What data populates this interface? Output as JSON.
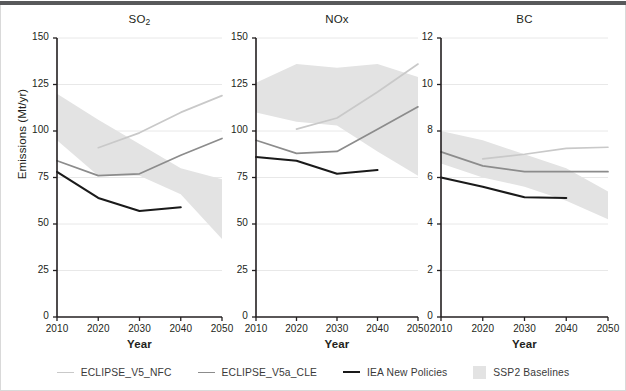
{
  "figure": {
    "ylabel": "Emissions (Mt/yr)",
    "xlabel_so2": "Year",
    "xlabel_nox": "Year",
    "xlabel_bc": "Year",
    "top_bar_color": "#58595b",
    "grid_color": "#e8e8e8",
    "axis_color": "#231f20"
  },
  "legend": {
    "position": "bottom-center",
    "items": [
      {
        "label": "ECLIPSE_V5_NFC",
        "type": "line",
        "color": "#c9c9c9"
      },
      {
        "label": "ECLIPSE_V5a_CLE",
        "type": "line",
        "color": "#8c8c8c"
      },
      {
        "label": "IEA New Policies",
        "type": "line",
        "color": "#1a1a1a"
      },
      {
        "label": "SSP2 Baselines",
        "type": "band",
        "color": "#e3e3e3"
      }
    ]
  },
  "chart_data": [
    {
      "type": "line",
      "title": "SO2",
      "title_display": "SO",
      "title_sub": "2",
      "xlabel": "Year",
      "ylabel": "Emissions (Mt/yr)",
      "xlim": [
        2010,
        2050
      ],
      "ylim": [
        0,
        150
      ],
      "yticks": [
        0,
        25,
        50,
        75,
        100,
        125,
        150
      ],
      "xticks": [
        2010,
        2020,
        2030,
        2040,
        2050
      ],
      "grid": true,
      "band": {
        "name": "SSP2 Baselines",
        "x": [
          2010,
          2020,
          2030,
          2040,
          2050
        ],
        "upper": [
          120,
          106,
          93,
          80,
          74
        ],
        "lower": [
          95,
          76,
          76,
          66,
          42
        ]
      },
      "series": [
        {
          "name": "ECLIPSE_V5_NFC",
          "color": "#c9c9c9",
          "x": [
            2020,
            2030,
            2040,
            2050
          ],
          "values": [
            91,
            99,
            110,
            119
          ]
        },
        {
          "name": "ECLIPSE_V5a_CLE",
          "color": "#8c8c8c",
          "x": [
            2010,
            2020,
            2030,
            2040,
            2050
          ],
          "values": [
            84,
            76,
            77,
            87,
            96
          ]
        },
        {
          "name": "IEA New Policies",
          "color": "#1a1a1a",
          "x": [
            2010,
            2020,
            2030,
            2040
          ],
          "values": [
            78,
            64,
            57,
            59
          ]
        }
      ]
    },
    {
      "type": "line",
      "title": "NOx",
      "title_display": "NOx",
      "title_sub": "",
      "xlabel": "Year",
      "ylabel": "Emissions (Mt/yr)",
      "xlim": [
        2010,
        2050
      ],
      "ylim": [
        0,
        150
      ],
      "yticks": [
        0,
        25,
        50,
        75,
        100,
        125,
        150
      ],
      "xticks": [
        2010,
        2020,
        2030,
        2040,
        2050
      ],
      "grid": true,
      "band": {
        "name": "SSP2 Baselines",
        "x": [
          2010,
          2020,
          2030,
          2040,
          2050
        ],
        "upper": [
          126,
          136,
          134,
          136,
          129
        ],
        "lower": [
          110,
          105,
          103,
          89,
          76
        ]
      },
      "series": [
        {
          "name": "ECLIPSE_V5_NFC",
          "color": "#c9c9c9",
          "x": [
            2020,
            2030,
            2040,
            2050
          ],
          "values": [
            101,
            107,
            121,
            136
          ]
        },
        {
          "name": "ECLIPSE_V5a_CLE",
          "color": "#8c8c8c",
          "x": [
            2010,
            2020,
            2030,
            2040,
            2050
          ],
          "values": [
            95,
            88,
            89,
            101,
            113
          ]
        },
        {
          "name": "IEA New Policies",
          "color": "#1a1a1a",
          "x": [
            2010,
            2020,
            2030,
            2040
          ],
          "values": [
            86,
            84,
            77,
            79
          ]
        }
      ]
    },
    {
      "type": "line",
      "title": "BC",
      "title_display": "BC",
      "title_sub": "",
      "xlabel": "Year",
      "ylabel": "Emissions (Mt/yr)",
      "xlim": [
        2010,
        2050
      ],
      "ylim": [
        0,
        12
      ],
      "yticks": [
        0,
        2,
        4,
        6,
        8,
        10,
        12
      ],
      "xticks": [
        2010,
        2020,
        2030,
        2040,
        2050
      ],
      "grid": true,
      "band": {
        "name": "SSP2 Baselines",
        "x": [
          2010,
          2020,
          2030,
          2040,
          2050
        ],
        "upper": [
          8.0,
          7.6,
          7.0,
          6.4,
          5.4
        ],
        "lower": [
          6.6,
          6.0,
          5.6,
          5.0,
          4.2
        ]
      },
      "series": [
        {
          "name": "ECLIPSE_V5_NFC",
          "color": "#c9c9c9",
          "x": [
            2020,
            2030,
            2040,
            2050
          ],
          "values": [
            6.8,
            7.0,
            7.25,
            7.3
          ]
        },
        {
          "name": "ECLIPSE_V5a_CLE",
          "color": "#8c8c8c",
          "x": [
            2010,
            2020,
            2030,
            2040,
            2050
          ],
          "values": [
            7.1,
            6.5,
            6.25,
            6.25,
            6.25
          ]
        },
        {
          "name": "IEA New Policies",
          "color": "#1a1a1a",
          "x": [
            2010,
            2020,
            2030,
            2040
          ],
          "values": [
            6.0,
            5.6,
            5.15,
            5.12
          ]
        }
      ]
    }
  ]
}
